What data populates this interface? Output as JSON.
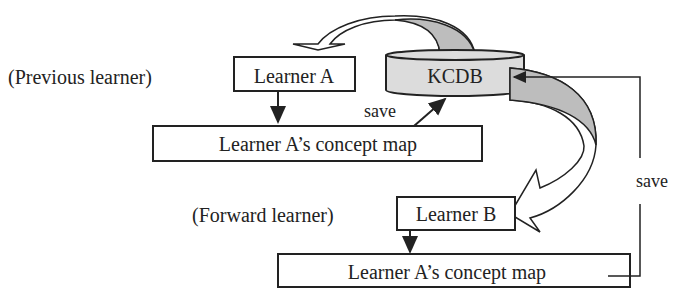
{
  "diagram": {
    "labels": {
      "previous_learner": "(Previous learner)",
      "forward_learner": "(Forward learner)"
    },
    "nodes": {
      "learner_a": "Learner A",
      "kcdb": "KCDB",
      "concept_map_a": "Learner A’s concept map",
      "learner_b": "Learner B",
      "concept_map_b": "Learner A’s concept map"
    },
    "edges": {
      "save_a": "save",
      "save_b": "save"
    },
    "colors": {
      "fill_light": "#dcdcdc",
      "fill_dark": "#bdbdbd",
      "stroke": "#222222"
    }
  }
}
